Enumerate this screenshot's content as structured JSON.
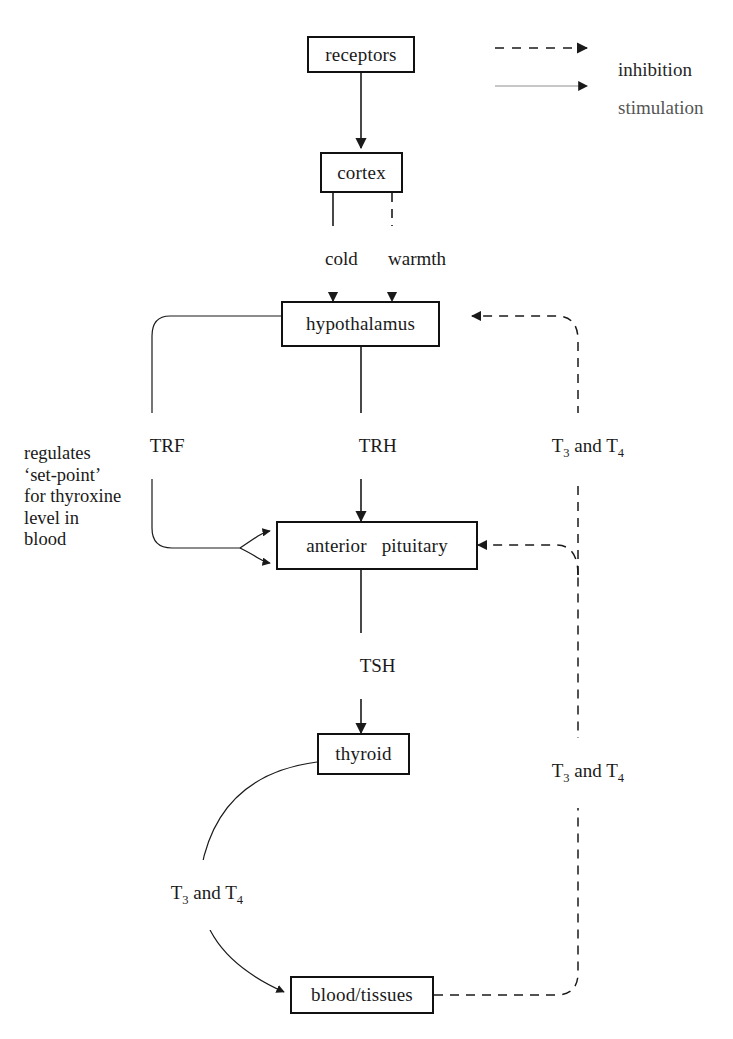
{
  "diagram": {
    "colors": {
      "line": "#1a1a1a",
      "faded_line": "#9a9a9a",
      "box_border": "#111111",
      "text": "#1a1a1a",
      "background": "#ffffff"
    },
    "nodes": [
      {
        "id": "receptors",
        "label": "receptors"
      },
      {
        "id": "cortex",
        "label": "cortex"
      },
      {
        "id": "hypothalamus",
        "label": "hypothalamus"
      },
      {
        "id": "anterior_pituitary",
        "label": "anterior   pituitary"
      },
      {
        "id": "thyroid",
        "label": "thyroid"
      },
      {
        "id": "blood_tissues",
        "label": "blood/tissues"
      }
    ],
    "edge_labels": {
      "cold": "cold",
      "warmth": "warmth",
      "trf": "TRF",
      "trh": "TRH",
      "tsh": "TSH",
      "t3t4_right_upper_prefix": "T",
      "t3t4_right_upper": "T3 and T4",
      "t3t4_right_lower": "T3 and T4",
      "t3t4_thyroid_blood": "T3 and T4"
    },
    "note": "regulates\n‘set-point’\nfor thyroxine\nlevel in\nblood",
    "legend": {
      "inhibition": "inhibition",
      "stimulation": "stimulation"
    }
  }
}
